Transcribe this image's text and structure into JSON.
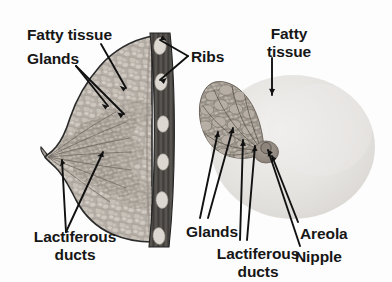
{
  "figure": {
    "background_color": "#fdfdfd",
    "label_color": "#161616"
  },
  "labels": {
    "fatty_tissue_left": "Fatty tissue",
    "glands_left": "Glands",
    "ribs": "Ribs",
    "fatty_tissue_right_line1": "Fatty",
    "fatty_tissue_right_line2": "tissue",
    "lactiferous_ducts_left_line1": "Lactiferous",
    "lactiferous_ducts_left_line2": "ducts",
    "glands_right": "Glands",
    "lactiferous_ducts_right_line1": "Lactiferous",
    "lactiferous_ducts_right_line2": "ducts",
    "areola": "Areola",
    "nipple": "Nipple"
  },
  "panels": {
    "left": {
      "name": "lateral-cross-section",
      "structures": [
        "fatty-tissue",
        "glands",
        "lactiferous-ducts",
        "nipple",
        "chest-wall",
        "ribs"
      ],
      "chest_wall_color": "#4a4a4a",
      "rib_color": "#d8d5cf",
      "tissue_color": "#b0aaa2",
      "rib_count": 6
    },
    "right": {
      "name": "frontal-cutaway",
      "structures": [
        "fatty-tissue",
        "glands",
        "lactiferous-ducts",
        "areola",
        "nipple"
      ],
      "outline_color": "#dedede",
      "gland_wedge_color": "#8d867c",
      "areola_color": "#9b938a"
    }
  }
}
